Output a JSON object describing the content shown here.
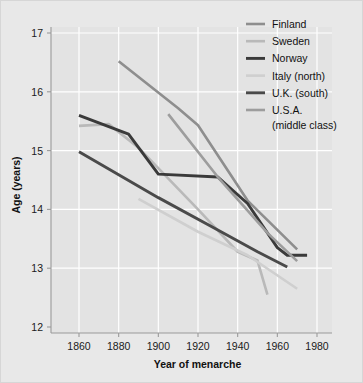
{
  "chart_data": {
    "type": "line",
    "title": "",
    "xlabel": "Year of menarche",
    "ylabel": "Age (years)",
    "xlim": [
      1850,
      1990
    ],
    "ylim": [
      12,
      17
    ],
    "xticks": [
      1860,
      1880,
      1900,
      1920,
      1940,
      1960,
      1980
    ],
    "yticks": [
      12,
      13,
      14,
      15,
      16,
      17
    ],
    "xtick_labels": [
      "1860",
      "1880",
      "1900",
      "1920",
      "1940",
      "1960",
      "1980"
    ],
    "ytick_labels": [
      "12",
      "13",
      "14",
      "15",
      "16",
      "17"
    ],
    "grid": true,
    "legend_position": "top-right",
    "series": [
      {
        "name": "Finland",
        "color": "#8e8e8e",
        "width": 2.6,
        "points": [
          [
            1880,
            16.52
          ],
          [
            1910,
            15.72
          ],
          [
            1920,
            15.43
          ],
          [
            1945,
            14.15
          ],
          [
            1970,
            13.32
          ]
        ]
      },
      {
        "name": "Sweden",
        "color": "#b9b9b9",
        "width": 2.6,
        "points": [
          [
            1860,
            15.42
          ],
          [
            1875,
            15.45
          ],
          [
            1890,
            15.05
          ],
          [
            1920,
            14.0
          ],
          [
            1940,
            13.28
          ],
          [
            1950,
            13.13
          ],
          [
            1955,
            12.55
          ]
        ]
      },
      {
        "name": "Norway",
        "color": "#3a3a3a",
        "width": 2.9,
        "points": [
          [
            1860,
            15.6
          ],
          [
            1885,
            15.28
          ],
          [
            1900,
            14.6
          ],
          [
            1930,
            14.55
          ],
          [
            1945,
            14.1
          ],
          [
            1960,
            13.35
          ],
          [
            1965,
            13.22
          ],
          [
            1975,
            13.22
          ]
        ]
      },
      {
        "name": "Italy (north)",
        "color": "#cfcfcf",
        "width": 2.6,
        "points": [
          [
            1890,
            14.18
          ],
          [
            1920,
            13.62
          ],
          [
            1945,
            13.22
          ],
          [
            1970,
            12.65
          ]
        ]
      },
      {
        "name": "U.K. (south)",
        "color": "#4a4a4a",
        "width": 2.9,
        "points": [
          [
            1860,
            14.98
          ],
          [
            1900,
            14.2
          ],
          [
            1930,
            13.65
          ],
          [
            1950,
            13.28
          ],
          [
            1965,
            13.02
          ]
        ]
      },
      {
        "name": "U.S.A. (middle class)",
        "color": "#9d9d9d",
        "width": 2.6,
        "points": [
          [
            1905,
            15.62
          ],
          [
            1930,
            14.55
          ],
          [
            1955,
            13.6
          ],
          [
            1970,
            13.12
          ]
        ]
      }
    ]
  },
  "legend": {
    "items": [
      {
        "label": "Finland",
        "sublabel": ""
      },
      {
        "label": "Sweden",
        "sublabel": ""
      },
      {
        "label": "Norway",
        "sublabel": ""
      },
      {
        "label": "Italy (north)",
        "sublabel": ""
      },
      {
        "label": "U.K. (south)",
        "sublabel": ""
      },
      {
        "label": "U.S.A.",
        "sublabel": "(middle class)"
      }
    ]
  },
  "colors": {
    "figure_background": "#e8e8e8",
    "plot_background": "#e3e3e3",
    "gridline": "#ffffff",
    "axis": "#9a9a9a",
    "text": "#111111"
  }
}
